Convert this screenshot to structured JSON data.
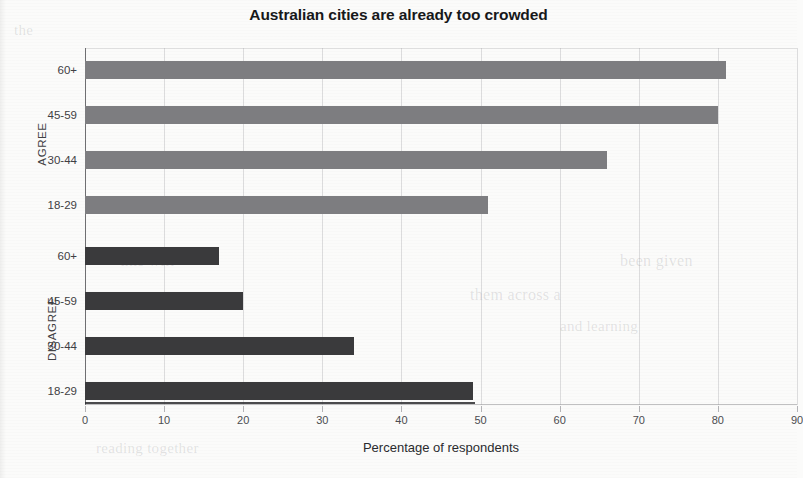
{
  "chart_data": {
    "type": "bar",
    "orientation": "horizontal",
    "title": "Australian cities are already too crowded",
    "xlabel": "Percentage of respondents",
    "ylabel": "",
    "xlim": [
      0,
      90
    ],
    "xticks": [
      0,
      10,
      20,
      30,
      40,
      50,
      60,
      70,
      80,
      90
    ],
    "grid": true,
    "legend": "none",
    "groups": [
      {
        "name": "AGREE",
        "color": "#7d7d80",
        "categories": [
          "60+",
          "45-59",
          "30-44",
          "18-29"
        ],
        "values": [
          81,
          80,
          66,
          51
        ]
      },
      {
        "name": "DISAGREE",
        "color": "#3a3a3c",
        "categories": [
          "60+",
          "45-59",
          "30-44",
          "18-29"
        ],
        "values": [
          17,
          20,
          34,
          49
        ]
      }
    ],
    "bars": [
      {
        "group": "AGREE",
        "category": "60+",
        "value": 81,
        "color": "#7d7d80"
      },
      {
        "group": "AGREE",
        "category": "45-59",
        "value": 80,
        "color": "#7d7d80"
      },
      {
        "group": "AGREE",
        "category": "30-44",
        "value": 66,
        "color": "#7d7d80"
      },
      {
        "group": "AGREE",
        "category": "18-29",
        "value": 51,
        "color": "#7d7d80"
      },
      {
        "group": "DISAGREE",
        "category": "60+",
        "value": 17,
        "color": "#3a3a3c"
      },
      {
        "group": "DISAGREE",
        "category": "45-59",
        "value": 20,
        "color": "#3a3a3c"
      },
      {
        "group": "DISAGREE",
        "category": "30-44",
        "value": 34,
        "color": "#3a3a3c"
      },
      {
        "group": "DISAGREE",
        "category": "18-29",
        "value": 49,
        "color": "#3a3a3c"
      }
    ]
  },
  "page": {
    "background_color": "#fbfbfa",
    "axis_color": "#6f6f72",
    "ghost_text": [
      "the",
      "this will",
      "them across a",
      "been given",
      "reading together",
      "and learning"
    ]
  }
}
